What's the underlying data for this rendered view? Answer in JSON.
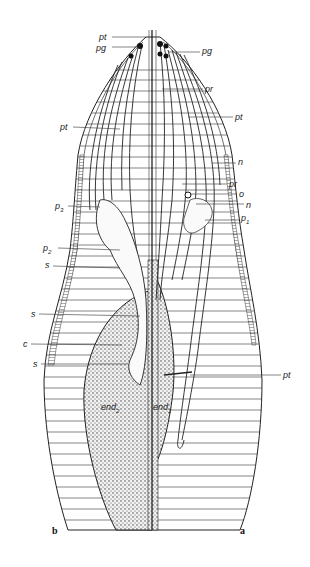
{
  "figure": {
    "panels": [
      {
        "id": "b",
        "label": "b",
        "x": 52,
        "y": 525
      },
      {
        "id": "a",
        "label": "a",
        "x": 240,
        "y": 525
      }
    ],
    "labels": [
      {
        "text": "pt",
        "sub": "",
        "x": 99,
        "y": 33,
        "lx1": 112,
        "ly1": 37,
        "lx2": 146,
        "ly2": 37
      },
      {
        "text": "pg",
        "sub": "",
        "x": 96,
        "y": 44,
        "lx1": 112,
        "ly1": 47,
        "lx2": 140,
        "ly2": 47
      },
      {
        "text": "pg",
        "sub": "",
        "x": 202,
        "y": 47,
        "lx1": 168,
        "ly1": 52,
        "lx2": 200,
        "ly2": 52
      },
      {
        "text": "pr",
        "sub": "",
        "x": 205,
        "y": 85,
        "lx1": 162,
        "ly1": 89,
        "lx2": 203,
        "ly2": 89
      },
      {
        "text": "pt",
        "sub": "",
        "x": 235,
        "y": 113,
        "lx1": 188,
        "ly1": 117,
        "lx2": 233,
        "ly2": 117
      },
      {
        "text": "pt",
        "sub": "",
        "x": 60,
        "y": 123,
        "lx1": 73,
        "ly1": 127,
        "lx2": 120,
        "ly2": 129
      },
      {
        "text": "n",
        "sub": "",
        "x": 238,
        "y": 158,
        "lx1": 212,
        "ly1": 163,
        "lx2": 236,
        "ly2": 163
      },
      {
        "text": "pr",
        "sub": "",
        "x": 229,
        "y": 180,
        "lx1": 182,
        "ly1": 184,
        "lx2": 227,
        "ly2": 184
      },
      {
        "text": "o",
        "sub": "",
        "x": 239,
        "y": 190,
        "lx1": 190,
        "ly1": 194,
        "lx2": 237,
        "ly2": 194
      },
      {
        "text": "n",
        "sub": "",
        "x": 246,
        "y": 201,
        "lx1": 196,
        "ly1": 204,
        "lx2": 244,
        "ly2": 204
      },
      {
        "text": "p",
        "sub": "1",
        "x": 241,
        "y": 214,
        "lx1": 205,
        "ly1": 220,
        "lx2": 239,
        "ly2": 220
      },
      {
        "text": "p",
        "sub": "3",
        "x": 55,
        "y": 202,
        "lx1": 68,
        "ly1": 206,
        "lx2": 100,
        "ly2": 207
      },
      {
        "text": "p",
        "sub": "2",
        "x": 43,
        "y": 244,
        "lx1": 58,
        "ly1": 248,
        "lx2": 120,
        "ly2": 250
      },
      {
        "text": "s",
        "sub": "",
        "x": 45,
        "y": 261,
        "lx1": 53,
        "ly1": 266,
        "lx2": 120,
        "ly2": 268
      },
      {
        "text": "s",
        "sub": "",
        "x": 31,
        "y": 310,
        "lx1": 39,
        "ly1": 314,
        "lx2": 140,
        "ly2": 316
      },
      {
        "text": "c",
        "sub": "",
        "x": 23,
        "y": 340,
        "lx1": 31,
        "ly1": 344,
        "lx2": 122,
        "ly2": 345
      },
      {
        "text": "s",
        "sub": "",
        "x": 33,
        "y": 360,
        "lx1": 41,
        "ly1": 364,
        "lx2": 128,
        "ly2": 364
      },
      {
        "text": "pt",
        "sub": "",
        "x": 283,
        "y": 371,
        "lx1": 190,
        "ly1": 375,
        "lx2": 281,
        "ly2": 375
      },
      {
        "text": "end",
        "sub": "2",
        "x": 101,
        "y": 403,
        "lx1": 0,
        "ly1": 0,
        "lx2": 0,
        "ly2": 0
      },
      {
        "text": "end",
        "sub": "1",
        "x": 153,
        "y": 403,
        "lx1": 0,
        "ly1": 0,
        "lx2": 0,
        "ly2": 0
      }
    ]
  }
}
